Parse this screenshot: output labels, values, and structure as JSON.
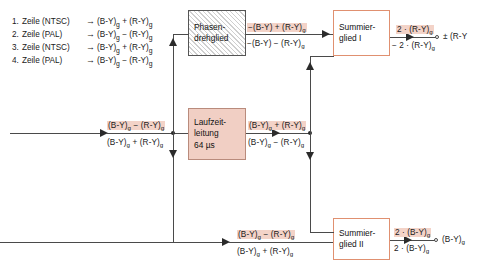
{
  "diagram": {
    "legend": [
      {
        "num": "1.",
        "name": "Zeile (NTSC)",
        "arrow": "→",
        "expr": "(B-Y)g + (R-Y)g"
      },
      {
        "num": "2.",
        "name": "Zeile (PAL)",
        "arrow": "→",
        "expr": "(B-Y)g − (R-Y)g"
      },
      {
        "num": "3.",
        "name": "Zeile (NTSC)",
        "arrow": "→",
        "expr": "(B-Y)g + (R-Y)g"
      },
      {
        "num": "4.",
        "name": "Zeile (PAL)",
        "arrow": "→",
        "expr": "(B-Y)g − (R-Y)g"
      }
    ],
    "blocks": {
      "phase_rotator": {
        "line1": "Phasen-",
        "line2": "drehglied"
      },
      "delay_line": {
        "line1": "Laufzeit-",
        "line2": "leitung",
        "line3": "64 µs"
      },
      "summer_one": {
        "line1": "Summier-",
        "line2": "glied I"
      },
      "summer_two": {
        "line1": "Summier-",
        "line2": "glied II"
      }
    },
    "signals": {
      "phase_out_top": "−(B-Y) + (R-Y)g",
      "phase_out_bot": "−(B-Y) − (R-Y)g",
      "input_top": "(B-Y)g − (R-Y)g",
      "input_bot": "(B-Y)g + (R-Y)g",
      "delay_out_top": "(B-Y)g + (R-Y)g",
      "delay_out_bot": "(B-Y)g − (R-Y)g",
      "sum1_out_top": "2 · (R-Y)g",
      "sum1_out_bot": "− 2 · (R-Y)g",
      "sum1_result": "± (R-Y",
      "sum2_in_top": "(B-Y)g − (R-Y)g",
      "sum2_in_bot": "(B-Y)g + (R-Y)g",
      "sum2_out_top": "2 · (B-Y)g",
      "sum2_out_bot": "2 · (B-Y)g",
      "sum2_result": "(B-Y)g"
    },
    "colors": {
      "highlight": "#f3d3c8",
      "box_fill": "#f1cfc4",
      "box_border_warm": "#e09070",
      "wire": "#4a4a4a"
    }
  }
}
